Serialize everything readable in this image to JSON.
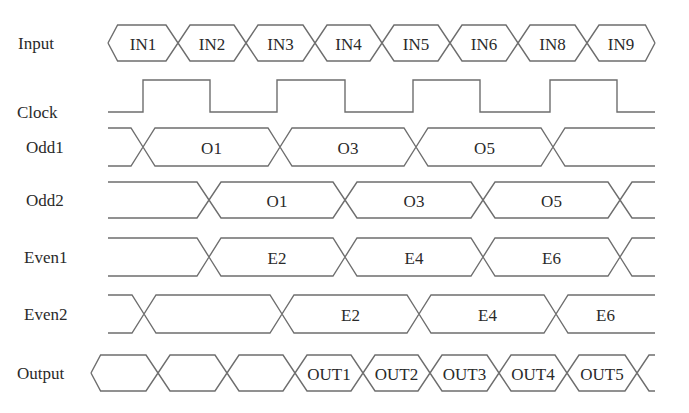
{
  "diagram": {
    "type": "timing-diagram",
    "signals": [
      {
        "name": "Input",
        "kind": "bus",
        "y": 43,
        "half": 18,
        "label_x": 18,
        "start": 108,
        "start_open": false,
        "end": 655,
        "end_open": false,
        "edges": [
          178,
          246,
          315,
          382,
          450,
          518,
          587
        ],
        "segments": [
          "IN1",
          "IN2",
          "IN3",
          "IN4",
          "IN5",
          "IN6",
          "IN8",
          "IN9"
        ]
      },
      {
        "name": "Clock",
        "kind": "clock",
        "low": 112,
        "high": 80,
        "label_x": 17,
        "start": 108,
        "end": 655,
        "edges": [
          143,
          210,
          277,
          345,
          413,
          480,
          550,
          617
        ]
      },
      {
        "name": "Odd1",
        "kind": "bus",
        "y": 147,
        "half": 19,
        "label_x": 26,
        "start": 108,
        "start_open": true,
        "end": 655,
        "end_open": true,
        "edges": [
          143,
          280,
          416,
          553
        ],
        "segments": [
          "",
          "O1",
          "O3",
          "O5",
          ""
        ]
      },
      {
        "name": "Odd2",
        "kind": "bus",
        "y": 200,
        "half": 18,
        "label_x": 26,
        "start": 108,
        "start_open": true,
        "end": 655,
        "end_open": true,
        "edges": [
          209,
          345,
          483,
          620
        ],
        "segments": [
          "",
          "O1",
          "O3",
          "O5",
          ""
        ]
      },
      {
        "name": "Even1",
        "kind": "bus",
        "y": 257,
        "half": 19,
        "label_x": 24,
        "start": 108,
        "start_open": true,
        "end": 655,
        "end_open": true,
        "edges": [
          209,
          345,
          483,
          620
        ],
        "segments": [
          "",
          "E2",
          "E4",
          "E6",
          ""
        ]
      },
      {
        "name": "Even2",
        "kind": "bus",
        "y": 314,
        "half": 19,
        "label_x": 24,
        "start": 108,
        "start_open": true,
        "end": 655,
        "end_open": true,
        "edges": [
          144,
          282,
          419,
          556
        ],
        "segments": [
          "",
          "",
          "E2",
          "E4",
          "E6"
        ]
      },
      {
        "name": "Output",
        "kind": "bus",
        "y": 373,
        "half": 18,
        "label_x": 17,
        "start": 91,
        "start_open": false,
        "end": 655,
        "end_open": true,
        "edges": [
          158,
          227,
          295,
          363,
          430,
          499,
          567,
          637
        ],
        "segments": [
          "",
          "",
          "",
          "OUT1",
          "OUT2",
          "OUT3",
          "OUT4",
          "OUT5",
          ""
        ]
      }
    ]
  },
  "labels": {
    "input": "Input",
    "clock": "Clock",
    "odd1": "Odd1",
    "odd2": "Odd2",
    "even1": "Even1",
    "even2": "Even2",
    "output": "Output"
  }
}
